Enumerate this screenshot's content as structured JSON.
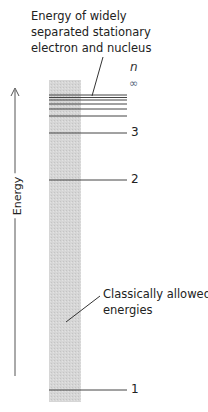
{
  "diagram": {
    "title_annotation": {
      "lines": [
        "Energy of widely",
        "separated stationary",
        "electron and nucleus"
      ]
    },
    "band_annotation": {
      "lines": [
        "Classically allowed",
        "energies"
      ]
    },
    "axis": {
      "label": "Energy",
      "direction": "up"
    },
    "quantum_number_header": "n",
    "infinity_symbol": "∞",
    "levels": [
      {
        "n": "1",
        "y": 390
      },
      {
        "n": "2",
        "y": 180
      },
      {
        "n": "3",
        "y": 133
      }
    ],
    "convergence_lines_y": [
      95,
      97.5,
      100,
      104,
      109,
      116
    ],
    "colors": {
      "band": "#d4d4d4",
      "line": "#333333",
      "infinity": "#5a6a80"
    }
  }
}
